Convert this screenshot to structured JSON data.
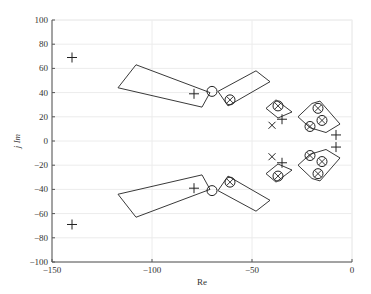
{
  "chart_data": {
    "type": "scatter",
    "title": "",
    "xlabel": "Re",
    "ylabel": "j Im",
    "xlim": [
      -150,
      0
    ],
    "ylim": [
      -100,
      100
    ],
    "xticks": [
      -150,
      -100,
      -50,
      0
    ],
    "yticks": [
      -100,
      -80,
      -60,
      -40,
      -20,
      0,
      20,
      40,
      60,
      80,
      100
    ],
    "grid": true,
    "legend": null,
    "series": [
      {
        "name": "plus markers",
        "marker": "+",
        "points": [
          [
            -140,
            69
          ],
          [
            -140,
            -69
          ],
          [
            -79,
            39
          ],
          [
            -79,
            -39
          ],
          [
            -35,
            18
          ],
          [
            -35,
            -18
          ],
          [
            -8,
            5
          ],
          [
            -8,
            -5
          ]
        ]
      },
      {
        "name": "circle markers",
        "marker": "o",
        "points": [
          [
            -70,
            41
          ],
          [
            -70,
            -41
          ]
        ]
      },
      {
        "name": "circled-cross markers",
        "marker": "otimes",
        "points": [
          [
            -61,
            34
          ],
          [
            -61,
            -34
          ],
          [
            -37,
            29
          ],
          [
            -37,
            -29
          ],
          [
            -21,
            12
          ],
          [
            -21,
            -12
          ],
          [
            -17,
            27
          ],
          [
            -17,
            -27
          ],
          [
            -15,
            17
          ],
          [
            -15,
            -17
          ]
        ]
      },
      {
        "name": "x markers",
        "marker": "x",
        "points": [
          [
            -40,
            13
          ],
          [
            -40,
            -13
          ]
        ]
      }
    ],
    "regions": [
      {
        "name": "region-1-upper",
        "polygon": [
          [
            -108,
            63
          ],
          [
            -117,
            44
          ],
          [
            -75,
            28
          ],
          [
            -71,
            40
          ]
        ]
      },
      {
        "name": "region-1-lower",
        "polygon": [
          [
            -108,
            -63
          ],
          [
            -117,
            -44
          ],
          [
            -75,
            -28
          ],
          [
            -71,
            -40
          ]
        ]
      },
      {
        "name": "region-2-upper",
        "polygon": [
          [
            -67,
            41
          ],
          [
            -62,
            29
          ],
          [
            -41,
            49
          ],
          [
            -48,
            58
          ]
        ]
      },
      {
        "name": "region-2-lower",
        "polygon": [
          [
            -67,
            -41
          ],
          [
            -62,
            -29
          ],
          [
            -41,
            -49
          ],
          [
            -48,
            -58
          ]
        ]
      },
      {
        "name": "region-3-upper",
        "polygon": [
          [
            -43,
            27
          ],
          [
            -38,
            34
          ],
          [
            -30,
            24
          ],
          [
            -37,
            19
          ]
        ]
      },
      {
        "name": "region-3-lower",
        "polygon": [
          [
            -43,
            -27
          ],
          [
            -38,
            -34
          ],
          [
            -30,
            -24
          ],
          [
            -37,
            -19
          ]
        ]
      },
      {
        "name": "region-4-upper",
        "polygon": [
          [
            -27,
            20
          ],
          [
            -20,
            31
          ],
          [
            -16,
            33
          ],
          [
            -6,
            14
          ],
          [
            -13,
            7
          ],
          [
            -21,
            11
          ]
        ]
      },
      {
        "name": "region-4-lower",
        "polygon": [
          [
            -27,
            -20
          ],
          [
            -20,
            -31
          ],
          [
            -16,
            -33
          ],
          [
            -6,
            -14
          ],
          [
            -13,
            -7
          ],
          [
            -21,
            -11
          ]
        ]
      }
    ]
  },
  "axes": {
    "xlabel": "Re",
    "ylabel": "j Im",
    "xtick_labels": [
      "−150",
      "−100",
      "−50",
      "0"
    ],
    "ytick_labels": [
      "100",
      "80",
      "60",
      "40",
      "20",
      "0",
      "−20",
      "−40",
      "−60",
      "−80",
      "−100"
    ]
  }
}
